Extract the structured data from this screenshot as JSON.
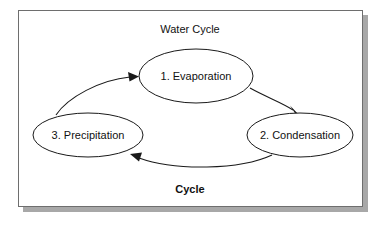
{
  "diagram": {
    "title": "Water Cycle",
    "footer": "Cycle",
    "bottom_caption_bold": true,
    "frame": {
      "border_color": "#6e6e6e",
      "background_color": "#ffffff",
      "shadow_color": "#a8a8a8"
    },
    "nodes": [
      {
        "id": "evaporation",
        "label": "1. Evaporation",
        "order": 1,
        "cx": 196,
        "cy": 76,
        "rx": 57,
        "ry": 27
      },
      {
        "id": "condensation",
        "label": "2. Condensation",
        "order": 2,
        "cx": 300,
        "cy": 135,
        "rx": 53,
        "ry": 22
      },
      {
        "id": "precipitation",
        "label": "3.  Precipitation",
        "order": 3,
        "cx": 88,
        "cy": 135,
        "rx": 55,
        "ry": 22
      }
    ],
    "edges": [
      {
        "id": "evaporation-to-condensation",
        "from": "evaporation",
        "to": "condensation",
        "arrow": true
      },
      {
        "id": "condensation-to-precipitation",
        "from": "condensation",
        "to": "precipitation",
        "arrow": true
      },
      {
        "id": "precipitation-to-evaporation",
        "from": "precipitation",
        "to": "evaporation",
        "arrow": true
      }
    ],
    "stroke_color": "#1a1a1a"
  }
}
